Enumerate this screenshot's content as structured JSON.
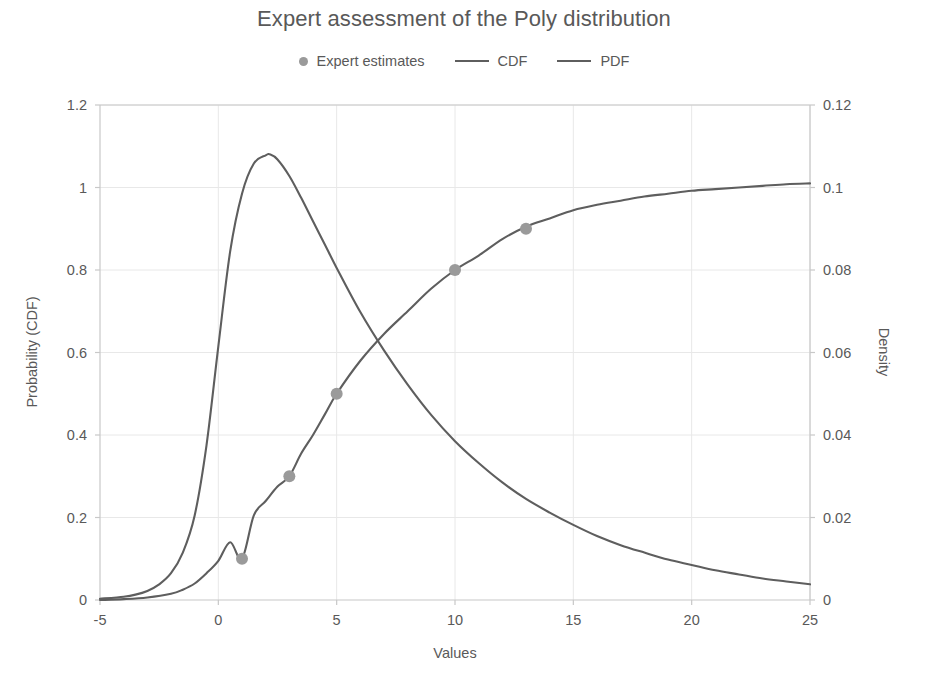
{
  "chart_data": {
    "type": "line",
    "title": "Expert assessment of the Poly distribution",
    "xlabel": "Values",
    "ylabel": "Probability (CDF)",
    "ylabel_right": "Density",
    "xlim": [
      -5,
      25
    ],
    "ylim": [
      0,
      1.2
    ],
    "ylim_right": [
      0,
      0.12
    ],
    "grid": true,
    "legend_position": "top-center",
    "xticks": [
      "-5",
      "0",
      "5",
      "10",
      "15",
      "20",
      "25"
    ],
    "xtick_values": [
      -5,
      0,
      5,
      10,
      15,
      20,
      25
    ],
    "yticks_left": [
      "0",
      "0.2",
      "0.4",
      "0.6",
      "0.8",
      "1",
      "1.2"
    ],
    "ytick_values_left": [
      0,
      0.2,
      0.4,
      0.6,
      0.8,
      1,
      1.2
    ],
    "yticks_right": [
      "0",
      "0.02",
      "0.04",
      "0.06",
      "0.08",
      "0.1",
      "0.12"
    ],
    "ytick_values_right": [
      0,
      0.02,
      0.04,
      0.06,
      0.08,
      0.1,
      0.12
    ],
    "colors": {
      "cdf_line": "#5e5e5e",
      "pdf_line": "#5e5e5e",
      "marker": "#9a9a9a",
      "grid": "#e8e8e8",
      "axis": "#c8c8c8",
      "text": "#595959"
    },
    "series": [
      {
        "name": "Expert estimates",
        "type": "scatter",
        "axis": "left",
        "x": [
          1,
          3,
          5,
          10,
          13
        ],
        "values": [
          0.1,
          0.3,
          0.5,
          0.8,
          0.9
        ]
      },
      {
        "name": "CDF",
        "type": "line",
        "axis": "left",
        "x": [
          -5,
          -4,
          -3,
          -2,
          -1.5,
          -1,
          -0.5,
          0,
          0.5,
          1,
          1.5,
          2,
          2.5,
          3,
          3.5,
          4,
          4.5,
          5,
          6,
          7,
          8,
          9,
          10,
          11,
          12,
          13,
          14,
          15,
          16,
          17,
          18,
          19,
          20,
          21,
          22,
          23,
          24,
          25
        ],
        "values": [
          0.0,
          0.002,
          0.006,
          0.015,
          0.025,
          0.04,
          0.065,
          0.095,
          0.14,
          0.1,
          0.205,
          0.24,
          0.275,
          0.3,
          0.355,
          0.4,
          0.45,
          0.5,
          0.58,
          0.645,
          0.7,
          0.755,
          0.8,
          0.835,
          0.875,
          0.905,
          0.925,
          0.945,
          0.958,
          0.968,
          0.978,
          0.985,
          0.992,
          0.996,
          1.0,
          1.004,
          1.008,
          1.01
        ]
      },
      {
        "name": "PDF",
        "type": "line",
        "axis": "right",
        "x": [
          -5,
          -4,
          -3.5,
          -3,
          -2.5,
          -2,
          -1.5,
          -1,
          -0.5,
          0,
          0.5,
          1,
          1.5,
          2,
          2.2,
          2.5,
          3,
          3.5,
          4,
          4.5,
          5,
          6,
          7,
          8,
          9,
          10,
          11,
          12,
          13,
          14,
          15,
          16,
          17,
          18,
          19,
          20,
          21,
          22,
          23,
          24,
          25
        ],
        "values": [
          0.0003,
          0.0008,
          0.0013,
          0.0022,
          0.0038,
          0.0065,
          0.0115,
          0.0205,
          0.0375,
          0.0615,
          0.0845,
          0.0985,
          0.1058,
          0.1078,
          0.108,
          0.1068,
          0.1028,
          0.0975,
          0.0918,
          0.0862,
          0.0805,
          0.0698,
          0.0605,
          0.0522,
          0.0448,
          0.0385,
          0.0332,
          0.0285,
          0.0245,
          0.0212,
          0.0182,
          0.0155,
          0.0133,
          0.0115,
          0.0098,
          0.0085,
          0.0072,
          0.0062,
          0.0052,
          0.0045,
          0.0038
        ]
      }
    ]
  },
  "legend": {
    "items": [
      {
        "label": "Expert estimates",
        "marker": "dot"
      },
      {
        "label": "CDF",
        "marker": "line"
      },
      {
        "label": "PDF",
        "marker": "line"
      }
    ]
  }
}
